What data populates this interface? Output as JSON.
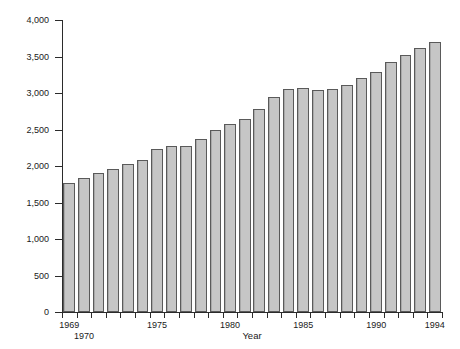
{
  "chart_data": {
    "type": "bar",
    "title": "",
    "xlabel": "Year",
    "ylabel": "Number (in thousands)",
    "categories": [
      "1969",
      "1970",
      "1971",
      "1972",
      "1973",
      "1974",
      "1975",
      "1976",
      "1977",
      "1978",
      "1979",
      "1980",
      "1981",
      "1982",
      "1983",
      "1984",
      "1985",
      "1986",
      "1987",
      "1988",
      "1989",
      "1990",
      "1991",
      "1992",
      "1993",
      "1994"
    ],
    "values": [
      1770,
      1830,
      1900,
      1960,
      2030,
      2080,
      2230,
      2280,
      2280,
      2370,
      2490,
      2580,
      2650,
      2780,
      2940,
      3060,
      3070,
      3040,
      3050,
      3110,
      3200,
      3290,
      3430,
      3520,
      3620,
      3700
    ],
    "ylim": [
      0,
      4000
    ],
    "ytick_values": [
      0,
      500,
      1000,
      1500,
      2000,
      2500,
      3000,
      3500,
      4000
    ],
    "ytick_labels": [
      "0",
      "500",
      "1,000",
      "1,500",
      "2,000",
      "2,500",
      "3,000",
      "3,500",
      "4,000"
    ],
    "xtick_labels": [
      {
        "year": "1969",
        "row": 0
      },
      {
        "year": "1970",
        "row": 1
      },
      {
        "year": "1975",
        "row": 0
      },
      {
        "year": "1980",
        "row": 0
      },
      {
        "year": "1985",
        "row": 0
      },
      {
        "year": "1990",
        "row": 0
      },
      {
        "year": "1994",
        "row": 0
      }
    ],
    "grid": false,
    "legend": null,
    "bar_color": "#bcbcbc",
    "bar_edge_color": "#5a5a5a",
    "axis_color": "#2b2b2b"
  }
}
